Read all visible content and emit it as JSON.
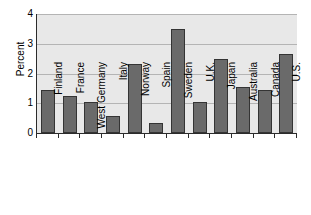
{
  "chart_data": {
    "type": "bar",
    "title": "",
    "xlabel": "",
    "ylabel": "Percent",
    "ylim": [
      0,
      4
    ],
    "yticks": [
      "0",
      "1",
      "2",
      "3",
      "4"
    ],
    "grid": true,
    "legend": "none",
    "categories": [
      "Finland",
      "France",
      "West Germany",
      "Italy",
      "Norway",
      "Spain",
      "Sweden",
      "U.K.",
      "Japan",
      "Australia",
      "Canada",
      "U.S."
    ],
    "values": [
      1.45,
      1.25,
      1.05,
      0.58,
      2.33,
      0.35,
      3.48,
      1.03,
      2.48,
      1.53,
      1.43,
      2.65
    ],
    "colors": {
      "bar_fill": "#6a6a6a",
      "bar_outline": "#343434",
      "plot_background": "#e8e8e8",
      "page_background": "#ffffff",
      "gridline": "#b4b4b4",
      "axis": "#2b2b2b",
      "text": "#000000"
    }
  }
}
